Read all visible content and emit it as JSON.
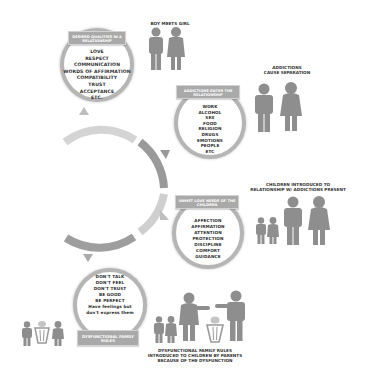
{
  "colors": {
    "figure": "#8e8e8e",
    "ring": "#b5b5b5",
    "banner": "#a9a9a9",
    "arc_dark": "#9a9a9a",
    "arc_light": "#cfcfcf"
  },
  "stage1": {
    "banner": "DESIRED QUALITIES IN A RELATIONSHIP",
    "items": [
      "LOVE",
      "RESPECT",
      "COMMUNICATION",
      "WORDS OF AFFIRMATION",
      "COMPATIBILITY",
      "TRUST",
      "ACCEPTANCE",
      "ETC."
    ],
    "caption": "BOY MEETS GIRL"
  },
  "stage2": {
    "banner": "ADDICTIONS ENTER THE RELATIONSHIP",
    "items": [
      "WORK",
      "ALCOHOL",
      "SEX",
      "FOOD",
      "RELIGION",
      "DRUGS",
      "EMOTIONS",
      "PEOPLE",
      "ETC"
    ],
    "caption": [
      "ADDICTIONS",
      "CAUSE SEPARATION"
    ]
  },
  "stage3": {
    "banner": "UNMET LOVE NEEDS OF THE CHILDREN",
    "items": [
      "AFFECTION",
      "AFFIRMATION",
      "ATTENTION",
      "PROTECTION",
      "DISCIPLINE",
      "COMFORT",
      "GUIDANCE"
    ],
    "caption": [
      "CHILDREN INTRODUCED TO",
      "RELATIONSHIP W/ ADDICTIONS PRESENT"
    ]
  },
  "stage4": {
    "banner": "DYSFUNCTIONAL FAMILY RULES",
    "items": [
      "DON'T TALK",
      "DON'T FEEL",
      "DON'T TRUST",
      "BE GOOD",
      "BE PERFECT",
      "Have feelings but",
      "don't express them"
    ],
    "caption": [
      "DYSFUNCTIONAL FAMILY RULES",
      "INTRODUCED TO CHILDREN BY PARENTS",
      "BECAUSE OF THE DYSFUNCTION"
    ]
  }
}
